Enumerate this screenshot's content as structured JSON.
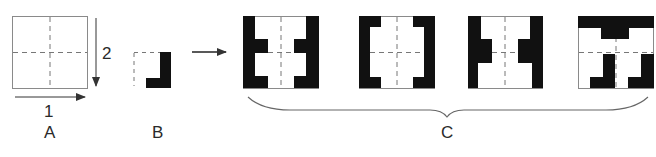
{
  "colors": {
    "ink": "#111111",
    "frame": "#8a8a8a",
    "dash": "#777777",
    "background": "#ffffff"
  },
  "panel_a": {
    "label": "A",
    "arrow_1_label": "1",
    "arrow_2_label": "2"
  },
  "panel_b": {
    "label": "B"
  },
  "transition_arrow": "right-arrow-icon",
  "panel_c": {
    "label": "C",
    "patterns": [
      {
        "name": "pattern-1"
      },
      {
        "name": "pattern-2"
      },
      {
        "name": "pattern-3"
      },
      {
        "name": "pattern-4"
      }
    ]
  }
}
